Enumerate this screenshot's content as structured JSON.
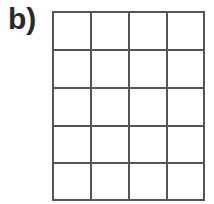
{
  "label": "b)",
  "grid": {
    "columns": 4,
    "rows": 5,
    "line_color": "#555555"
  }
}
